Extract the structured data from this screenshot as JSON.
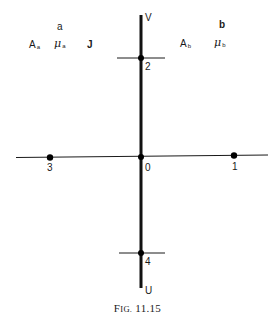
{
  "figure": {
    "caption_prefix": "F",
    "caption_smallcaps": "IG.",
    "caption_number": "11.15"
  },
  "regions": {
    "a": {
      "title": "a",
      "symbol_A": "A",
      "symbol_A_sub": "a",
      "symbol_mu": "μ",
      "symbol_mu_sub": "a",
      "extra": "J"
    },
    "b": {
      "title": "b",
      "symbol_A": "A",
      "symbol_A_sub": "b",
      "symbol_mu": "μ",
      "symbol_mu_sub": "b"
    }
  },
  "axes": {
    "vertical_top_label": "V",
    "vertical_bottom_label": "U"
  },
  "points": [
    {
      "id": "0",
      "label": "0"
    },
    {
      "id": "1",
      "label": "1"
    },
    {
      "id": "2",
      "label": "2"
    },
    {
      "id": "3",
      "label": "3"
    },
    {
      "id": "4",
      "label": "4"
    }
  ],
  "colors": {
    "ink": "#1a1a1a",
    "background": "#ffffff"
  }
}
